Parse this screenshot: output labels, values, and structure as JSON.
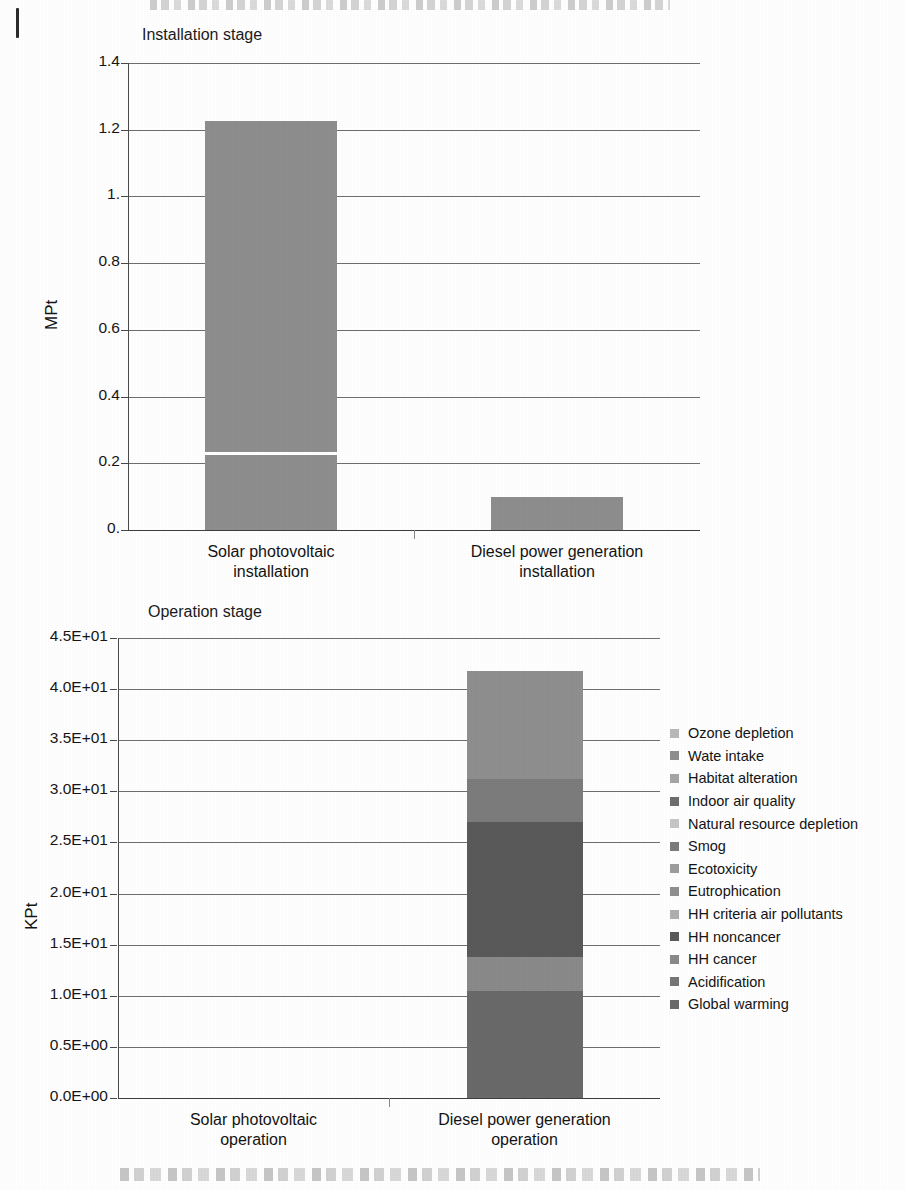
{
  "document": {
    "top_partial_text": "",
    "bottom_partial_text": ""
  },
  "charts": {
    "installation": {
      "title": "Installation stage",
      "ylabel": "MPt",
      "yticks": [
        "1.4",
        "1.2",
        "1.",
        "0.8",
        "0.6",
        "0.4",
        "0.2",
        "0."
      ],
      "categories": [
        "Solar photovoltaic\ninstallation",
        "Diesel power generation\ninstallation"
      ],
      "cat1_line1": "Solar photovoltaic",
      "cat1_line2": "installation",
      "cat2_line1": "Diesel power generation",
      "cat2_line2": "installation"
    },
    "operation": {
      "title": "Operation stage",
      "ylabel": "KPt",
      "yticks": [
        "4.5E+01",
        "4.0E+01",
        "3.5E+01",
        "3.0E+01",
        "2.5E+01",
        "2.0E+01",
        "1.5E+01",
        "1.0E+01",
        "0.5E+00",
        "0.0E+00"
      ],
      "cat1_line1": "Solar photovoltaic",
      "cat1_line2": "operation",
      "cat2_line1": "Diesel power generation",
      "cat2_line2": "operation"
    }
  },
  "legend": {
    "items": [
      {
        "label": "Ozone depletion",
        "color": "#b9b9b9"
      },
      {
        "label": "Wate intake",
        "color": "#8f8f8f"
      },
      {
        "label": "Habitat alteration",
        "color": "#a6a6a6"
      },
      {
        "label": "Indoor air quality",
        "color": "#6e6e6e"
      },
      {
        "label": "Natural resource depletion",
        "color": "#c6c6c6"
      },
      {
        "label": "Smog",
        "color": "#7c7c7c"
      },
      {
        "label": "Ecotoxicity",
        "color": "#9d9d9d"
      },
      {
        "label": "Eutrophication",
        "color": "#909090"
      },
      {
        "label": "HH criteria air pollutants",
        "color": "#b0b0b0"
      },
      {
        "label": "HH noncancer",
        "color": "#5a5a5a"
      },
      {
        "label": "HH cancer",
        "color": "#8a8a8a"
      },
      {
        "label": "Acidification",
        "color": "#767676"
      },
      {
        "label": "Global warming",
        "color": "#6a6a6a"
      }
    ]
  },
  "chart_data": [
    {
      "type": "bar",
      "id": "installation-stage",
      "title": "Installation stage",
      "xlabel": "",
      "ylabel": "MPt",
      "ylim": [
        0,
        1.4
      ],
      "ytick_values": [
        0,
        0.2,
        0.4,
        0.6,
        0.8,
        1.0,
        1.2,
        1.4
      ],
      "ytick_labels": [
        "0.",
        "0.2",
        "0.4",
        "0.6",
        "0.8",
        "1.",
        "1.2",
        "1.4"
      ],
      "grid": true,
      "legend_position": "none",
      "categories": [
        "Solar photovoltaic installation",
        "Diesel power generation installation"
      ],
      "values": [
        1.225,
        0.1
      ],
      "stacked_detail": {
        "Solar photovoltaic installation": [
          {
            "name": "lower segment",
            "value": 0.23
          },
          {
            "name": "upper segment",
            "value": 0.995
          }
        ],
        "Diesel power generation installation": [
          {
            "name": "single segment",
            "value": 0.1
          }
        ]
      },
      "notes": "Solar PV installation total approx. 1.22 MPt; a thin white separator divides the bar at approx. 0.23 MPt. Diesel installation approx. 0.10 MPt."
    },
    {
      "type": "bar",
      "id": "operation-stage",
      "title": "Operation stage",
      "xlabel": "",
      "ylabel": "KPt",
      "ylim": [
        0,
        45
      ],
      "ytick_values": [
        0,
        5,
        10,
        15,
        20,
        25,
        30,
        35,
        40,
        45
      ],
      "ytick_labels": [
        "0.0E+00",
        "0.5E+00",
        "1.0E+01",
        "1.5E+01",
        "2.0E+01",
        "2.5E+01",
        "3.0E+01",
        "3.5E+01",
        "4.0E+01",
        "4.5E+01"
      ],
      "grid": true,
      "legend_position": "right",
      "stacked": true,
      "categories": [
        "Solar photovoltaic operation",
        "Diesel power generation operation"
      ],
      "series": [
        {
          "name": "Global warming",
          "values": [
            0,
            10.5
          ]
        },
        {
          "name": "Acidification",
          "values": [
            0,
            0.0
          ]
        },
        {
          "name": "HH cancer",
          "values": [
            0,
            3.3
          ]
        },
        {
          "name": "HH noncancer",
          "values": [
            0,
            13.2
          ]
        },
        {
          "name": "HH criteria air pollutants",
          "values": [
            0,
            0.0
          ]
        },
        {
          "name": "Eutrophication",
          "values": [
            0,
            0.0
          ]
        },
        {
          "name": "Ecotoxicity",
          "values": [
            0,
            0.0
          ]
        },
        {
          "name": "Smog",
          "values": [
            0,
            4.2
          ]
        },
        {
          "name": "Natural resource depletion",
          "values": [
            0,
            0.0
          ]
        },
        {
          "name": "Indoor air quality",
          "values": [
            0,
            0.0
          ]
        },
        {
          "name": "Habitat alteration",
          "values": [
            0,
            0.0
          ]
        },
        {
          "name": "Wate intake",
          "values": [
            0,
            10.6
          ]
        },
        {
          "name": "Ozone depletion",
          "values": [
            0,
            0.0
          ]
        }
      ],
      "totals": [
        0,
        41.8
      ],
      "notes": "Solar photovoltaic operation is essentially zero. Diesel power generation operation totals approx. 41.8 KPt with visible segment boundaries at approx. 10.5, 13.8, 27.0 and 31.2 KPt."
    }
  ]
}
